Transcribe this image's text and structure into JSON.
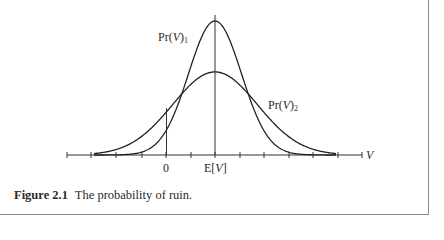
{
  "figure": {
    "number_label": "Figure 2.1",
    "caption_text": "The probability of ruin."
  },
  "chart_data": {
    "type": "line",
    "title": "The probability of ruin.",
    "xlabel": "V",
    "ylabel": "",
    "x_ticks": [
      "",
      "",
      "",
      "",
      "0",
      "",
      "E[V]",
      "",
      "",
      "",
      "",
      "",
      ""
    ],
    "tick_count": 13,
    "grid": false,
    "series": [
      {
        "name": "Pr(V)1",
        "label_base": "Pr(",
        "label_var": "V",
        "label_close": ")",
        "label_sub": "1",
        "distribution": "normal",
        "mean": "E[V]",
        "relative_sd": 1.0,
        "relative_peak": 1.0
      },
      {
        "name": "Pr(V)2",
        "label_base": "Pr(",
        "label_var": "V",
        "label_close": ")",
        "label_sub": "2",
        "distribution": "normal",
        "mean": "E[V]",
        "relative_sd": 1.6,
        "relative_peak": 0.62
      }
    ],
    "annotations": [
      {
        "text": "0",
        "position": "x tick 5",
        "note": "vertical line at V=0 up to curve"
      },
      {
        "text": "E[V]",
        "position": "x tick 7",
        "note": "vertical line at mean through peaks"
      }
    ]
  },
  "axis": {
    "x_label": "V",
    "tick_zero": "0",
    "tick_mean_prefix": "E[",
    "tick_mean_var": "V",
    "tick_mean_suffix": "]"
  },
  "labels": {
    "curve1_base": "Pr(",
    "curve1_var": "V",
    "curve1_close": ")",
    "curve1_sub": "1",
    "curve2_base": "Pr(",
    "curve2_var": "V",
    "curve2_close": ")",
    "curve2_sub": "2"
  }
}
